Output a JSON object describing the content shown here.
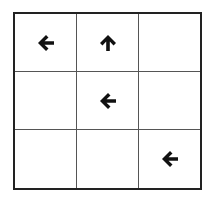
{
  "board": {
    "rows": 3,
    "cols": 3,
    "border_color": "#222222",
    "arrow_color": "#111111",
    "cells": [
      {
        "row": 0,
        "col": 0,
        "icon": "arrow-left"
      },
      {
        "row": 0,
        "col": 1,
        "icon": "arrow-up"
      },
      {
        "row": 0,
        "col": 2,
        "icon": null
      },
      {
        "row": 1,
        "col": 0,
        "icon": null
      },
      {
        "row": 1,
        "col": 1,
        "icon": "arrow-left"
      },
      {
        "row": 1,
        "col": 2,
        "icon": null
      },
      {
        "row": 2,
        "col": 0,
        "icon": null
      },
      {
        "row": 2,
        "col": 1,
        "icon": null
      },
      {
        "row": 2,
        "col": 2,
        "icon": "arrow-left"
      }
    ]
  }
}
